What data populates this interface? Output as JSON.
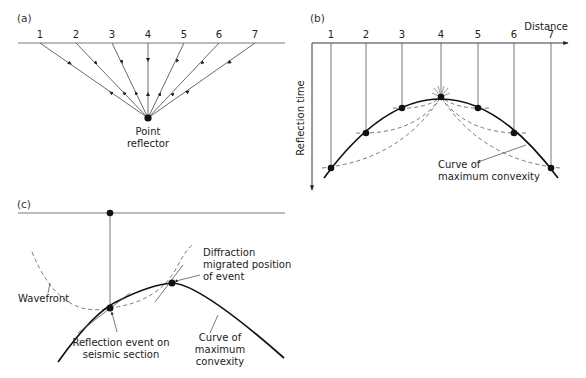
{
  "figure": {
    "panels": [
      {
        "id": "a",
        "label": "(a)",
        "stations": [
          "1",
          "2",
          "3",
          "4",
          "5",
          "6",
          "7"
        ],
        "reflector_label_line1": "Point",
        "reflector_label_line2": "reflector"
      },
      {
        "id": "b",
        "label": "(b)",
        "stations": [
          "1",
          "2",
          "3",
          "4",
          "5",
          "6",
          "7"
        ],
        "x_axis_label": "Distance",
        "y_axis_label": "Reflection time",
        "curve_label_line1": "Curve of",
        "curve_label_line2": "maximum convexity"
      },
      {
        "id": "c",
        "label": "(c)",
        "wavefront_label": "Wavefront",
        "diffraction_label_line1": "Diffraction",
        "diffraction_label_line2": "migrated position",
        "diffraction_label_line3": "of event",
        "reflection_label_line1": "Reflection event on",
        "reflection_label_line2": "seismic section",
        "curve_label_line1": "Curve of",
        "curve_label_line2": "maximum",
        "curve_label_line3": "convexity"
      }
    ]
  }
}
